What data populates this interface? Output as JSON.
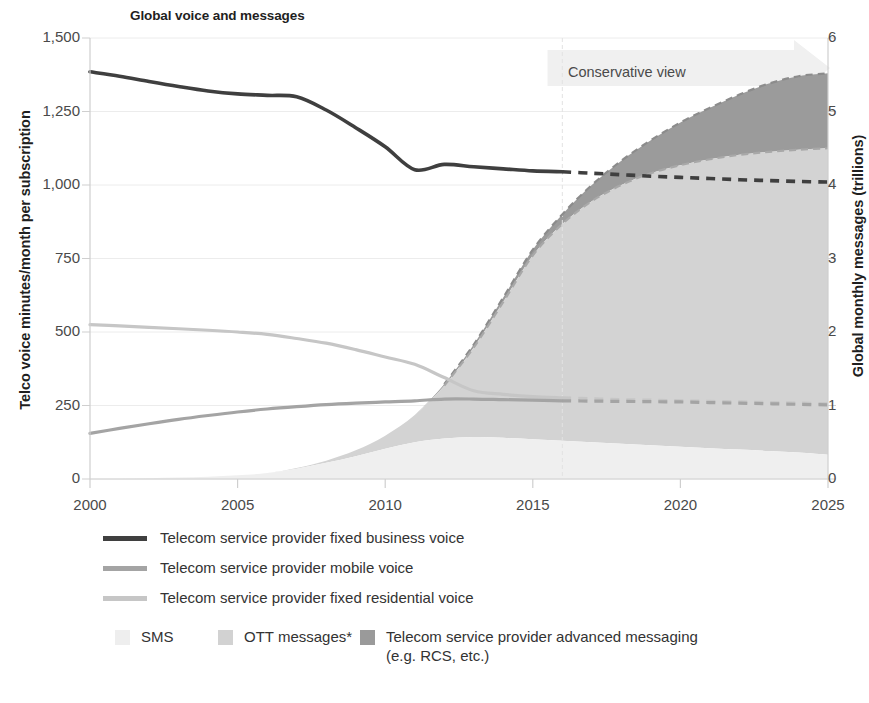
{
  "chart_title": "Global voice and messages",
  "axes": {
    "y_left_title": "Telco voice minutes/month per subscription",
    "y_right_title": "Global monthly messages (trillions)",
    "x_title": "",
    "y_left_ticks": [
      "0",
      "250",
      "500",
      "750",
      "1,000",
      "1,250",
      "1,500"
    ],
    "y_right_ticks": [
      "0",
      "1",
      "2",
      "3",
      "4",
      "5",
      "6"
    ],
    "x_ticks": [
      "2000",
      "2005",
      "2010",
      "2015",
      "2020",
      "2025"
    ]
  },
  "annotations": {
    "conservative_view": "Conservative view"
  },
  "legend": {
    "lines": [
      {
        "label": "Telecom service provider fixed business voice",
        "color": "#3f3f3f"
      },
      {
        "label": "Telecom service provider mobile voice",
        "color": "#a4a4a4"
      },
      {
        "label": "Telecom service provider fixed residential voice",
        "color": "#c6c6c6"
      }
    ],
    "areas": [
      {
        "label": "SMS",
        "sublabel": "",
        "color": "#eeeeee"
      },
      {
        "label": "OTT messages*",
        "sublabel": "",
        "color": "#d2d2d2"
      },
      {
        "label": "Telecom service provider advanced messaging",
        "sublabel": "(e.g. RCS, etc.)",
        "color": "#9a9a9a"
      }
    ]
  },
  "footnote": "",
  "colors": {
    "business_voice": "#3f3f3f",
    "mobile_voice": "#a4a4a4",
    "residential_voice": "#c6c6c6",
    "sms_area": "#efefef",
    "ott_area": "#d3d3d3",
    "advanced_area": "#9b9b9b",
    "grid": "#ececec",
    "axis": "#cfcfcf",
    "banner": "#f0f0f0"
  },
  "chart_data": {
    "type": "area",
    "title": "Global voice and messages",
    "xlabel": "",
    "ylabel": "Telco voice minutes/month per subscription",
    "y2label": "Global monthly messages (trillions)",
    "xlim": [
      2000,
      2025
    ],
    "ylim": [
      0,
      1500
    ],
    "y2lim": [
      0,
      6
    ],
    "grid": true,
    "legend_position": "bottom",
    "forecast_start": 2016,
    "x": [
      2000,
      2001,
      2002,
      2003,
      2004,
      2005,
      2006,
      2007,
      2008,
      2009,
      2010,
      2011,
      2012,
      2013,
      2014,
      2015,
      2016,
      2017,
      2018,
      2019,
      2020,
      2021,
      2022,
      2023,
      2024,
      2025
    ],
    "series": [
      {
        "name": "Telecom service provider fixed business voice",
        "axis": "left",
        "unit": "minutes/month per subscription",
        "style": "line",
        "color": "#3f3f3f",
        "values": [
          1385,
          1370,
          1352,
          1335,
          1320,
          1310,
          1305,
          1300,
          1255,
          1195,
          1130,
          1052,
          1070,
          1062,
          1055,
          1048,
          1045,
          1040,
          1035,
          1030,
          1026,
          1022,
          1018,
          1015,
          1012,
          1010
        ],
        "dashed_from": 2016
      },
      {
        "name": "Telecom service provider mobile voice",
        "axis": "left",
        "unit": "minutes/month per subscription",
        "style": "line",
        "color": "#a4a4a4",
        "values": [
          155,
          172,
          188,
          203,
          216,
          228,
          238,
          246,
          253,
          258,
          262,
          266,
          272,
          272,
          270,
          268,
          266,
          265,
          264,
          263,
          262,
          260,
          258,
          256,
          254,
          252
        ],
        "dashed_from": 2016
      },
      {
        "name": "Telecom service provider fixed residential voice",
        "axis": "left",
        "unit": "minutes/month per subscription",
        "style": "line",
        "color": "#c6c6c6",
        "values": [
          525,
          521,
          516,
          511,
          506,
          500,
          492,
          478,
          462,
          440,
          415,
          390,
          345,
          300,
          288,
          280,
          276,
          273,
          270,
          268,
          266,
          264,
          262,
          260,
          258,
          256
        ],
        "dashed_from": 2016
      },
      {
        "name": "SMS",
        "axis": "right",
        "unit": "trillions of messages per month",
        "style": "stacked-area",
        "color": "#efefef",
        "values": [
          0.0,
          0.0,
          0.01,
          0.02,
          0.03,
          0.05,
          0.08,
          0.14,
          0.22,
          0.31,
          0.41,
          0.5,
          0.55,
          0.57,
          0.56,
          0.54,
          0.52,
          0.5,
          0.48,
          0.46,
          0.44,
          0.42,
          0.4,
          0.38,
          0.36,
          0.33
        ]
      },
      {
        "name": "OTT messages*",
        "axis": "right",
        "unit": "trillions of messages per month",
        "style": "stacked-area",
        "color": "#d3d3d3",
        "values": [
          0.0,
          0.0,
          0.0,
          0.0,
          0.0,
          0.0,
          0.0,
          0.01,
          0.03,
          0.08,
          0.18,
          0.37,
          0.72,
          1.22,
          1.85,
          2.5,
          2.95,
          3.28,
          3.52,
          3.7,
          3.83,
          3.93,
          4.01,
          4.07,
          4.12,
          4.17
        ],
        "dashed_from": 2016
      },
      {
        "name": "Telecom service provider advanced messaging (e.g. RCS, etc.)",
        "axis": "right",
        "unit": "trillions of messages per month",
        "style": "stacked-area",
        "color": "#9b9b9b",
        "values": [
          0.0,
          0.0,
          0.0,
          0.0,
          0.0,
          0.0,
          0.0,
          0.0,
          0.0,
          0.0,
          0.0,
          0.0,
          0.02,
          0.04,
          0.06,
          0.08,
          0.13,
          0.22,
          0.33,
          0.45,
          0.58,
          0.7,
          0.82,
          0.93,
          1.0,
          1.02
        ],
        "dashed_from": 2016
      }
    ],
    "stacked_totals_2025": {
      "sms": 0.33,
      "ott": 4.5,
      "advanced": 5.52
    }
  }
}
